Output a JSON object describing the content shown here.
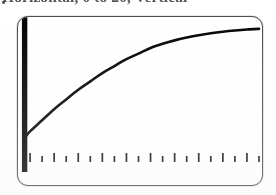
{
  "caption": {
    "bullet": "•",
    "text": "Horizontal, 0 to 20, Vertical",
    "note": "clipped at top edge of image"
  },
  "screen": {
    "label": "graphing-calculator-screen",
    "background_color": "#ffffff",
    "frame_color": "#4a4a4a",
    "curve_color": "#000000"
  },
  "chart_data": {
    "type": "line",
    "title": "",
    "subtitle": "",
    "xlabel": "",
    "ylabel": "",
    "xlim": [
      0,
      20
    ],
    "ylim": [
      0,
      1
    ],
    "grid": false,
    "legend": false,
    "axis": {
      "y_axis_style": "thick-vertical-bar",
      "y_axis_x_value": 0.55,
      "x_axis_tick_count": 20,
      "x_axis_tick_spacing": 1,
      "x_axis_major_every": 2
    },
    "series": [
      {
        "name": "curve",
        "description": "increasing concave-down saturating curve",
        "x": [
          0.6,
          1,
          2,
          3,
          4,
          5,
          6,
          7,
          8,
          9,
          10,
          11,
          12,
          13,
          14,
          15,
          16,
          17,
          18,
          19,
          20
        ],
        "y": [
          0.18,
          0.22,
          0.3,
          0.38,
          0.45,
          0.52,
          0.58,
          0.64,
          0.69,
          0.74,
          0.78,
          0.82,
          0.85,
          0.875,
          0.895,
          0.912,
          0.926,
          0.937,
          0.946,
          0.953,
          0.958
        ]
      },
      {
        "name": "vertical-axis-bar",
        "description": "thick black vertical line at left of screen",
        "x": [
          0.55,
          0.55
        ],
        "y": [
          0.0,
          1.0
        ]
      }
    ],
    "ticks": [
      {
        "x": 1,
        "major": true
      },
      {
        "x": 2,
        "major": false
      },
      {
        "x": 3,
        "major": true
      },
      {
        "x": 4,
        "major": false
      },
      {
        "x": 5,
        "major": true
      },
      {
        "x": 6,
        "major": false
      },
      {
        "x": 7,
        "major": true
      },
      {
        "x": 8,
        "major": false
      },
      {
        "x": 9,
        "major": true
      },
      {
        "x": 10,
        "major": false
      },
      {
        "x": 11,
        "major": true
      },
      {
        "x": 12,
        "major": false
      },
      {
        "x": 13,
        "major": true
      },
      {
        "x": 14,
        "major": false
      },
      {
        "x": 15,
        "major": true
      },
      {
        "x": 16,
        "major": false
      },
      {
        "x": 17,
        "major": true
      },
      {
        "x": 18,
        "major": false
      },
      {
        "x": 19,
        "major": true
      },
      {
        "x": 20,
        "major": false
      }
    ]
  }
}
